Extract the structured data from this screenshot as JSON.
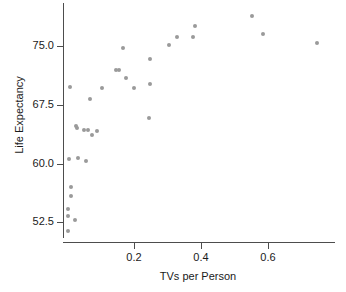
{
  "chart_data": {
    "type": "scatter",
    "title": "",
    "xlabel": "TVs per Person",
    "ylabel": "Life Expectancy",
    "xlim": [
      -0.01,
      0.8
    ],
    "ylim": [
      50.0,
      80.5
    ],
    "xticks": [
      0.2,
      0.4,
      0.6
    ],
    "xticklabels": [
      "0.2",
      "0.4",
      "0.6"
    ],
    "yticks": [
      52.5,
      60.0,
      67.5,
      75.0
    ],
    "yticklabels": [
      "52.5",
      "60.0",
      "67.5",
      "75.0"
    ],
    "grid": false,
    "legend": null,
    "marker_color": "#9a9a9a",
    "axis_color": "#4d4d4d",
    "points": [
      {
        "x": 0.004,
        "y": 51.4
      },
      {
        "x": 0.005,
        "y": 54.2
      },
      {
        "x": 0.006,
        "y": 53.3
      },
      {
        "x": 0.007,
        "y": 60.6
      },
      {
        "x": 0.01,
        "y": 69.8
      },
      {
        "x": 0.013,
        "y": 57.0
      },
      {
        "x": 0.014,
        "y": 55.9
      },
      {
        "x": 0.025,
        "y": 52.8
      },
      {
        "x": 0.03,
        "y": 64.8
      },
      {
        "x": 0.033,
        "y": 64.5
      },
      {
        "x": 0.035,
        "y": 60.7
      },
      {
        "x": 0.053,
        "y": 64.3
      },
      {
        "x": 0.058,
        "y": 60.3
      },
      {
        "x": 0.063,
        "y": 64.3
      },
      {
        "x": 0.07,
        "y": 68.3
      },
      {
        "x": 0.075,
        "y": 63.6
      },
      {
        "x": 0.092,
        "y": 64.2
      },
      {
        "x": 0.105,
        "y": 69.7
      },
      {
        "x": 0.148,
        "y": 71.9
      },
      {
        "x": 0.158,
        "y": 71.9
      },
      {
        "x": 0.168,
        "y": 74.7
      },
      {
        "x": 0.178,
        "y": 70.9
      },
      {
        "x": 0.2,
        "y": 69.7
      },
      {
        "x": 0.245,
        "y": 65.8
      },
      {
        "x": 0.248,
        "y": 70.2
      },
      {
        "x": 0.25,
        "y": 73.3
      },
      {
        "x": 0.305,
        "y": 75.2
      },
      {
        "x": 0.33,
        "y": 76.1
      },
      {
        "x": 0.378,
        "y": 76.1
      },
      {
        "x": 0.382,
        "y": 77.6
      },
      {
        "x": 0.552,
        "y": 78.9
      },
      {
        "x": 0.585,
        "y": 76.6
      },
      {
        "x": 0.745,
        "y": 75.4
      }
    ]
  }
}
